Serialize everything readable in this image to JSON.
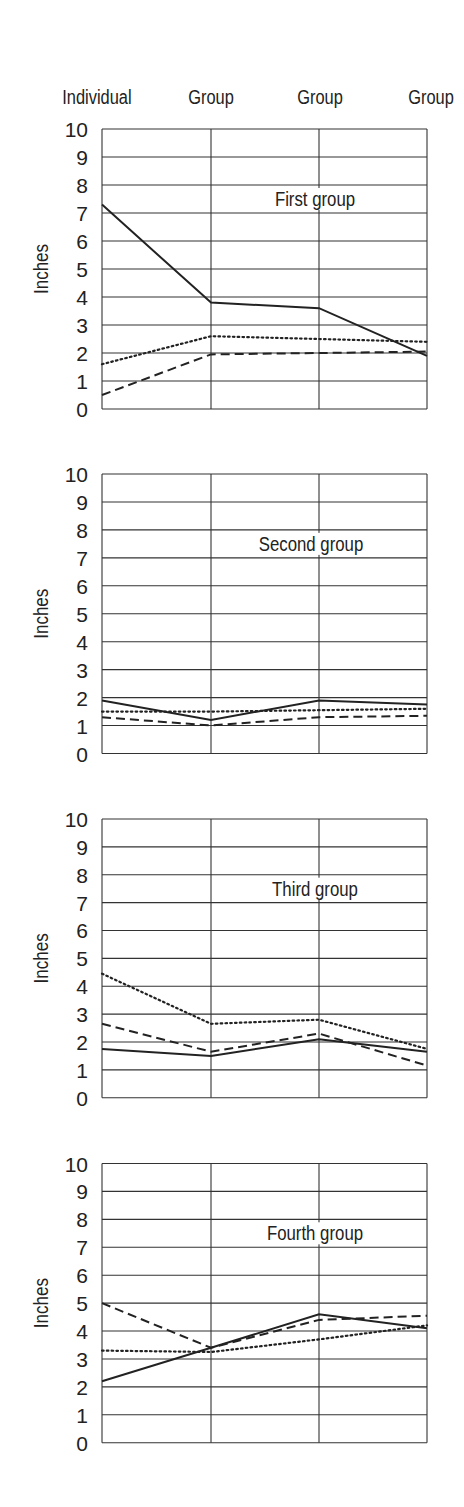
{
  "figure": {
    "column_labels": [
      "Individual",
      "Group",
      "Group",
      "Group"
    ],
    "y_axis_label": "Inches",
    "y_ticks": [
      0,
      1,
      2,
      3,
      4,
      5,
      6,
      7,
      8,
      9,
      10
    ]
  },
  "styles": {
    "line_color": "#222222",
    "grid_color": "#333333",
    "background": "#ffffff"
  },
  "chart_data": [
    {
      "type": "line",
      "title": "First group",
      "categories": [
        "Individual",
        "Group",
        "Group",
        "Group"
      ],
      "xlabel": "",
      "ylabel": "Inches",
      "ylim": [
        0,
        10
      ],
      "grid": true,
      "series": [
        {
          "name": "solid",
          "style": "solid",
          "values": [
            7.3,
            3.8,
            3.6,
            1.9
          ]
        },
        {
          "name": "dotted",
          "style": "dotted",
          "values": [
            1.6,
            2.6,
            2.5,
            2.4
          ]
        },
        {
          "name": "dashed",
          "style": "dashed",
          "values": [
            0.5,
            1.95,
            2.0,
            2.05
          ]
        }
      ]
    },
    {
      "type": "line",
      "title": "Second group",
      "categories": [
        "Individual",
        "Group",
        "Group",
        "Group"
      ],
      "xlabel": "",
      "ylabel": "Inches",
      "ylim": [
        0,
        10
      ],
      "grid": true,
      "series": [
        {
          "name": "solid",
          "style": "solid",
          "values": [
            1.9,
            1.2,
            1.9,
            1.75
          ]
        },
        {
          "name": "dotted",
          "style": "dotted",
          "values": [
            1.5,
            1.5,
            1.55,
            1.6
          ]
        },
        {
          "name": "dashed",
          "style": "dashed",
          "values": [
            1.3,
            1.0,
            1.3,
            1.35
          ]
        }
      ]
    },
    {
      "type": "line",
      "title": "Third group",
      "categories": [
        "Individual",
        "Group",
        "Group",
        "Group"
      ],
      "xlabel": "",
      "ylabel": "Inches",
      "ylim": [
        0,
        10
      ],
      "grid": true,
      "series": [
        {
          "name": "solid",
          "style": "solid",
          "values": [
            1.75,
            1.5,
            2.1,
            1.65
          ]
        },
        {
          "name": "dotted",
          "style": "dotted",
          "values": [
            4.45,
            2.65,
            2.8,
            1.75
          ]
        },
        {
          "name": "dashed",
          "style": "dashed",
          "values": [
            2.65,
            1.65,
            2.3,
            1.15
          ]
        }
      ]
    },
    {
      "type": "line",
      "title": "Fourth group",
      "categories": [
        "Individual",
        "Group",
        "Group",
        "Group"
      ],
      "xlabel": "",
      "ylabel": "Inches",
      "ylim": [
        0,
        10
      ],
      "grid": true,
      "series": [
        {
          "name": "solid",
          "style": "solid",
          "values": [
            2.2,
            3.4,
            4.6,
            4.1
          ]
        },
        {
          "name": "dotted",
          "style": "dotted",
          "values": [
            3.3,
            3.25,
            3.7,
            4.2
          ]
        },
        {
          "name": "dashed",
          "style": "dashed",
          "values": [
            5.0,
            3.4,
            4.4,
            4.55
          ]
        }
      ]
    }
  ]
}
